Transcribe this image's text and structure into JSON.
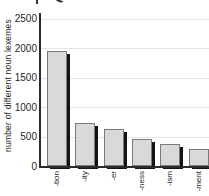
{
  "chart_data": {
    "type": "bar",
    "categories": [
      "-tion",
      "-ity",
      "-er",
      "-ness",
      "-ism",
      "-ment"
    ],
    "values": [
      1950,
      730,
      620,
      460,
      380,
      290
    ],
    "title": "",
    "xlabel": "",
    "ylabel": "number of different noun lexemes",
    "ylim": [
      0,
      2500
    ],
    "yticks": [
      0,
      500,
      1000,
      1500,
      2000,
      2500
    ],
    "grid": true,
    "legend": false,
    "colors": {
      "bar_fill": "#d9d9d9",
      "bar_border": "#7a7a7a",
      "bar_shadow": "#141414",
      "axis": "#2b2b2b",
      "gridline": "#e4e4e4",
      "text": "#1f1f1f",
      "background": "#ffffff"
    }
  }
}
